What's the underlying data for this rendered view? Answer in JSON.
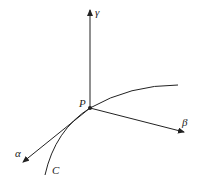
{
  "diagram": {
    "labels": {
      "gamma": "γ",
      "beta": "β",
      "alpha": "α",
      "point": "P",
      "curve": "C"
    },
    "color": "#222222"
  }
}
